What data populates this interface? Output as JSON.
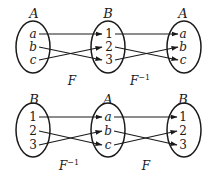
{
  "diagram": {
    "title": "",
    "colors": {
      "ink": "#1a1a1a",
      "background": "#ffffff"
    },
    "top_row": {
      "sets": [
        {
          "label": "A",
          "elements": [
            "a",
            "b",
            "c"
          ]
        },
        {
          "label": "B",
          "elements": [
            "1",
            "2",
            "3"
          ]
        },
        {
          "label": "A",
          "elements": [
            "a",
            "b",
            "c"
          ]
        }
      ],
      "maps": [
        {
          "label": "F",
          "superscript": "",
          "pairs": [
            [
              "a",
              "1"
            ],
            [
              "b",
              "3"
            ],
            [
              "c",
              "2"
            ]
          ]
        },
        {
          "label": "F",
          "superscript": "−1",
          "pairs": [
            [
              "1",
              "a"
            ],
            [
              "2",
              "c"
            ],
            [
              "3",
              "b"
            ]
          ]
        }
      ]
    },
    "bottom_row": {
      "sets": [
        {
          "label": "B",
          "elements": [
            "1",
            "2",
            "3"
          ]
        },
        {
          "label": "A",
          "elements": [
            "a",
            "b",
            "c"
          ]
        },
        {
          "label": "B",
          "elements": [
            "1",
            "2",
            "3"
          ]
        }
      ],
      "maps": [
        {
          "label": "F",
          "superscript": "−1",
          "pairs": [
            [
              "1",
              "a"
            ],
            [
              "2",
              "c"
            ],
            [
              "3",
              "b"
            ]
          ]
        },
        {
          "label": "F",
          "superscript": "",
          "pairs": [
            [
              "a",
              "1"
            ],
            [
              "b",
              "3"
            ],
            [
              "c",
              "2"
            ]
          ]
        }
      ]
    }
  }
}
